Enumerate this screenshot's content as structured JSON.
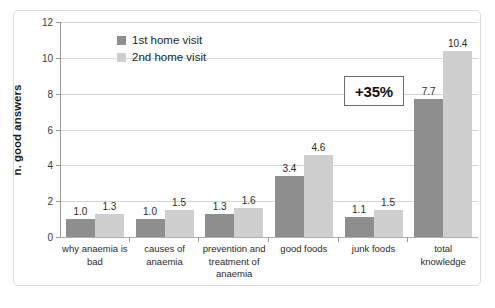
{
  "chart_data": {
    "type": "bar",
    "title": "",
    "subtitle": "",
    "xlabel": "",
    "ylabel": "n. good answers",
    "ylim": [
      0,
      12
    ],
    "yticks": [
      0,
      2,
      4,
      6,
      8,
      10,
      12
    ],
    "ytick_labels": [
      "0",
      "2",
      "4",
      "6",
      "8",
      "10",
      "12"
    ],
    "grid": "horizontal",
    "legend_position": "inside-top-left",
    "categories": [
      "why anaemia is bad",
      "causes of anaemia",
      "prevention and treatment of anaemia",
      "good foods",
      "junk foods",
      "total knowledge"
    ],
    "series": [
      {
        "name": "1st home visit",
        "color": "#8e8e8e",
        "values": [
          1.0,
          1.0,
          1.3,
          3.4,
          1.1,
          7.7
        ],
        "value_labels": [
          "1.0",
          "1.0",
          "1.3",
          "3.4",
          "1.1",
          "7.7"
        ]
      },
      {
        "name": "2nd home visit",
        "color": "#cfcfcf",
        "values": [
          1.3,
          1.5,
          1.6,
          4.6,
          1.5,
          10.4
        ],
        "value_labels": [
          "1.3",
          "1.5",
          "1.6",
          "4.6",
          "1.5",
          "10.4"
        ]
      }
    ],
    "annotations": [
      {
        "text": "+35%",
        "kind": "boxed-callout"
      }
    ]
  },
  "axis": {
    "y_title": "n. good answers",
    "y_ticks": [
      "12",
      "10",
      "8",
      "6",
      "4",
      "2",
      "0"
    ]
  },
  "legend": {
    "items": [
      {
        "label": "1st home visit",
        "swatch": "legend-swatch-dark"
      },
      {
        "label": "2nd home visit",
        "swatch": "legend-swatch-light"
      }
    ]
  },
  "x_categories": [
    {
      "lines": [
        "why anaemia is",
        "bad"
      ]
    },
    {
      "lines": [
        "causes of",
        "anaemia"
      ]
    },
    {
      "lines": [
        "prevention and",
        "treatment of",
        "anaemia"
      ]
    },
    {
      "lines": [
        "good foods"
      ]
    },
    {
      "lines": [
        "junk foods"
      ]
    },
    {
      "lines": [
        "total",
        "knowledge"
      ]
    }
  ],
  "annotation": {
    "text": "+35%"
  }
}
